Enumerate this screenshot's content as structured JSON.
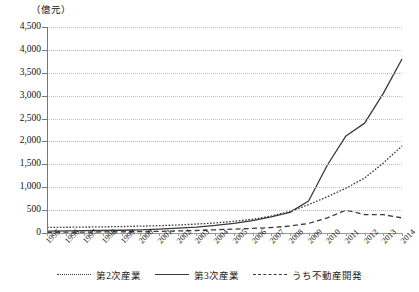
{
  "chart_data": {
    "type": "line",
    "title": "",
    "unit_label": "（億元）",
    "xlabel": "",
    "ylabel": "",
    "ylim": [
      0,
      4500
    ],
    "ytick_step": 500,
    "grid": true,
    "legend_position": "bottom",
    "ytick_labels": [
      "4,500",
      "4,000",
      "3,500",
      "3,000",
      "2,500",
      "2,000",
      "1,500",
      "1,000",
      "500",
      "0"
    ],
    "categories": [
      "1995",
      "1996",
      "1997",
      "1998",
      "1999",
      "2000",
      "2001",
      "2002",
      "2003",
      "2004",
      "2005",
      "2006",
      "2007",
      "2008",
      "2009",
      "2010",
      "2011",
      "2012",
      "2013",
      "2014"
    ],
    "series": [
      {
        "name": "第2次産業",
        "style": "dotted",
        "color": "#3a3a3a",
        "values": [
          120,
          125,
          130,
          135,
          140,
          150,
          160,
          175,
          195,
          220,
          255,
          300,
          370,
          470,
          620,
          790,
          980,
          1200,
          1530,
          1900
        ]
      },
      {
        "name": "第3次産業",
        "style": "solid",
        "color": "#3a3a3a",
        "values": [
          40,
          45,
          50,
          55,
          60,
          70,
          85,
          105,
          130,
          165,
          210,
          270,
          350,
          450,
          700,
          1480,
          2120,
          2400,
          3050,
          3800
        ]
      },
      {
        "name": "うち不動産開発",
        "style": "dashed",
        "color": "#3a3a3a",
        "values": [
          15,
          18,
          20,
          23,
          26,
          30,
          36,
          45,
          55,
          70,
          85,
          100,
          120,
          150,
          210,
          330,
          500,
          400,
          400,
          330
        ]
      }
    ]
  },
  "legend": {
    "items": [
      {
        "label": "第2次産業",
        "style": "dotted"
      },
      {
        "label": "第3次産業",
        "style": "solid"
      },
      {
        "label": "うち不動産開発",
        "style": "dashed"
      }
    ]
  }
}
